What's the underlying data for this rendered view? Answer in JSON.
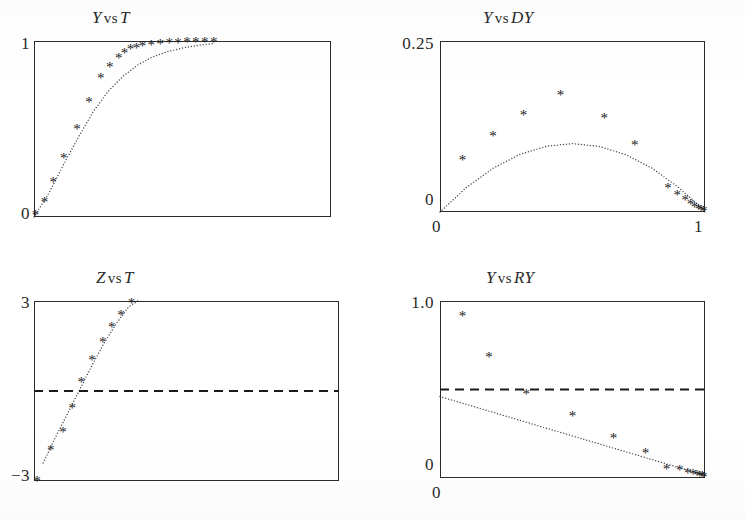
{
  "figure": {
    "style": "scanned-grayscale-scientific-plot",
    "layout": "2x2",
    "marker_glyph": "*",
    "ink_color": "#1a1a1a",
    "frame_color": "#2b2b2b",
    "background": "#ffffff"
  },
  "panels": [
    {
      "id": "y-vs-t",
      "title_parts": {
        "var1": "Y",
        "vs": "vs",
        "var2": "T"
      },
      "title_text": "Y vs T",
      "y_ticks": [
        "1",
        "0"
      ],
      "x_ticks": [],
      "has_dashed_reference": false,
      "fit_style": "dotted",
      "chart_data": {
        "type": "scatter",
        "title": "Y vs T",
        "xlabel": "T",
        "ylabel": "Y",
        "xlim": [
          0,
          1
        ],
        "ylim": [
          0,
          1
        ],
        "grid": false,
        "legend": "none",
        "series": [
          {
            "name": "observed",
            "marker": "asterisk",
            "x": [
              0.005,
              0.035,
              0.065,
              0.1,
              0.145,
              0.185,
              0.225,
              0.255,
              0.285,
              0.305,
              0.325,
              0.345,
              0.365,
              0.395,
              0.425,
              0.455,
              0.485,
              0.515,
              0.545,
              0.575,
              0.605
            ],
            "y": [
              0.015,
              0.085,
              0.2,
              0.335,
              0.5,
              0.655,
              0.79,
              0.855,
              0.905,
              0.935,
              0.955,
              0.965,
              0.975,
              0.982,
              0.987,
              0.99,
              0.992,
              0.994,
              0.995,
              0.996,
              0.997
            ]
          },
          {
            "name": "fitted",
            "marker": "dotted-curve",
            "x": [
              0.0,
              0.05,
              0.1,
              0.15,
              0.2,
              0.25,
              0.3,
              0.35,
              0.4,
              0.45,
              0.5,
              0.55,
              0.6
            ],
            "y": [
              0.0,
              0.135,
              0.3,
              0.455,
              0.6,
              0.715,
              0.8,
              0.865,
              0.91,
              0.94,
              0.96,
              0.975,
              0.985
            ]
          }
        ]
      }
    },
    {
      "id": "y-vs-dy",
      "title_parts": {
        "var1": "Y",
        "vs": "vs",
        "var2": "DY"
      },
      "title_text": "Y vs DY",
      "y_ticks": [
        "0.25",
        "0"
      ],
      "x_ticks": [
        "0",
        "1"
      ],
      "has_dashed_reference": false,
      "fit_style": "dotted",
      "chart_data": {
        "type": "scatter",
        "title": "Y vs DY",
        "xlabel": "Y",
        "ylabel": "DY",
        "xlim": [
          0,
          1
        ],
        "ylim": [
          0,
          0.25
        ],
        "grid": false,
        "legend": "none",
        "series": [
          {
            "name": "observed",
            "marker": "asterisk",
            "x": [
              0.085,
              0.2,
              0.315,
              0.455,
              0.62,
              0.735,
              0.86,
              0.895,
              0.925,
              0.945,
              0.96,
              0.975,
              0.985,
              0.995
            ],
            "y": [
              0.077,
              0.112,
              0.143,
              0.172,
              0.138,
              0.098,
              0.036,
              0.026,
              0.018,
              0.012,
              0.008,
              0.005,
              0.003,
              0.002
            ]
          },
          {
            "name": "fitted-parabola",
            "marker": "dotted-curve",
            "x": [
              0.0,
              0.1,
              0.2,
              0.3,
              0.4,
              0.5,
              0.6,
              0.7,
              0.8,
              0.9,
              0.97,
              1.0
            ],
            "y": [
              0.0,
              0.036,
              0.064,
              0.084,
              0.096,
              0.1,
              0.096,
              0.084,
              0.064,
              0.036,
              0.012,
              0.0
            ]
          }
        ]
      }
    },
    {
      "id": "z-vs-t",
      "title_parts": {
        "var1": "Z",
        "vs": "vs",
        "var2": "T"
      },
      "title_text": "Z vs T",
      "y_ticks": [
        "3",
        "−3"
      ],
      "x_ticks": [],
      "has_dashed_reference": true,
      "dashed_reference_value": 0,
      "fit_style": "dotted",
      "chart_data": {
        "type": "scatter",
        "title": "Z vs T",
        "xlabel": "T",
        "ylabel": "Z",
        "xlim": [
          0,
          1
        ],
        "ylim": [
          -3,
          3
        ],
        "grid": false,
        "legend": "none",
        "reference_line": {
          "orientation": "horizontal",
          "value": 0,
          "style": "dashed"
        },
        "series": [
          {
            "name": "observed",
            "marker": "asterisk",
            "x": [
              0.01,
              0.055,
              0.095,
              0.125,
              0.155,
              0.19,
              0.225,
              0.255,
              0.285,
              0.32
            ],
            "y": [
              -3.0,
              -1.95,
              -1.35,
              -0.55,
              0.3,
              1.05,
              1.65,
              2.15,
              2.55,
              2.95
            ]
          },
          {
            "name": "fitted",
            "marker": "dotted-curve",
            "x": [
              0.03,
              0.07,
              0.11,
              0.15,
              0.19,
              0.23,
              0.27,
              0.31,
              0.34
            ],
            "y": [
              -2.4,
              -1.55,
              -0.75,
              0.05,
              0.85,
              1.6,
              2.25,
              2.8,
              3.0
            ]
          }
        ]
      }
    },
    {
      "id": "y-vs-ry",
      "title_parts": {
        "var1": "Y",
        "vs": "vs",
        "var2": "RY"
      },
      "title_text": "Y vs RY",
      "y_ticks": [
        "1.0",
        "0"
      ],
      "x_ticks": [
        "0"
      ],
      "has_dashed_reference": true,
      "dashed_reference_value": 0.5,
      "fit_style": "dotted",
      "chart_data": {
        "type": "scatter",
        "title": "Y vs RY",
        "xlabel": "Y",
        "ylabel": "RY",
        "xlim": [
          0,
          1
        ],
        "ylim": [
          0,
          1.0
        ],
        "grid": false,
        "legend": "none",
        "reference_line": {
          "orientation": "horizontal",
          "value": 0.5,
          "style": "dashed"
        },
        "series": [
          {
            "name": "observed",
            "marker": "asterisk",
            "x": [
              0.085,
              0.185,
              0.325,
              0.5,
              0.655,
              0.775,
              0.855,
              0.905,
              0.935,
              0.955,
              0.97,
              0.98,
              0.99,
              0.995
            ],
            "y": [
              0.915,
              0.685,
              0.475,
              0.355,
              0.23,
              0.145,
              0.055,
              0.045,
              0.03,
              0.025,
              0.02,
              0.015,
              0.012,
              0.01
            ]
          },
          {
            "name": "fitted-line",
            "marker": "dotted-line",
            "x": [
              0.0,
              1.0
            ],
            "y": [
              0.46,
              0.015
            ]
          }
        ]
      }
    }
  ]
}
